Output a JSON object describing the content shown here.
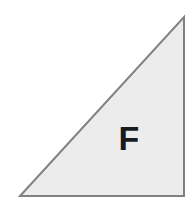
{
  "figure": {
    "canvas": {
      "width": 192,
      "height": 213,
      "background_color": "#ffffff"
    },
    "shape": {
      "name": "right-triangle",
      "label": "F",
      "fill_color": "#ececec",
      "stroke_color": "#808080",
      "stroke_width": 2,
      "vertices": [
        {
          "name": "bottom-left-vertex",
          "x": 20,
          "y": 196
        },
        {
          "name": "bottom-right-vertex",
          "x": 184,
          "y": 196
        },
        {
          "name": "top-right-vertex",
          "x": 184,
          "y": 17
        }
      ],
      "points_attr": "20,196 184,196 184,17",
      "right_angle_at": "bottom-right-vertex"
    },
    "label": {
      "text": "F",
      "color": "#1a1a1a",
      "x": 129,
      "y": 138,
      "font_size_px": 34,
      "font_weight": "bold"
    }
  }
}
